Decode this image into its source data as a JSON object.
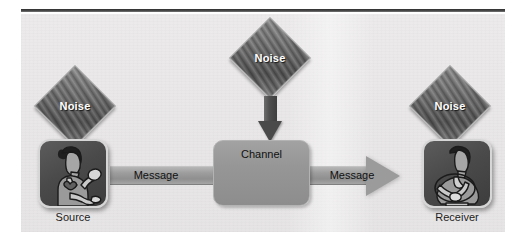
{
  "diagram": {
    "title_text": "",
    "nodes": {
      "source": {
        "label": "Source",
        "icon": "person-speaking-icon"
      },
      "receiver": {
        "label": "Receiver",
        "icon": "person-listening-icon"
      },
      "channel": {
        "label": "Channel"
      }
    },
    "noise": {
      "left_label": "Noise",
      "top_label": "Noise",
      "right_label": "Noise"
    },
    "messages": {
      "left_label": "Message",
      "right_label": "Message"
    },
    "colors": {
      "panel_background": "#eae8e8",
      "tile_fill": "#4a4a4a",
      "tile_border": "#d6d6d6",
      "channel_fill": "#969696",
      "arrow_fill": "#9b9b9b",
      "noise_fill": "#6a6a6a",
      "noise_text": "#ffffff",
      "label_text": "#1c1c1c",
      "rule": "#2e2e2e"
    }
  }
}
